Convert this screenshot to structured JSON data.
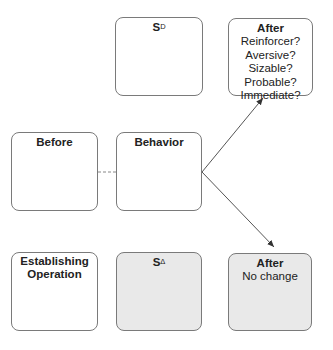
{
  "diagram": {
    "boxes": {
      "sd": {
        "label": "S",
        "sup": "D"
      },
      "after_top": {
        "title": "After",
        "lines": [
          "Reinforcer?",
          "Aversive?",
          "Sizable?",
          "Probable?",
          "Immediate?"
        ]
      },
      "before": {
        "title": "Before"
      },
      "behavior": {
        "title": "Behavior"
      },
      "eo": {
        "title_line1": "Establishing",
        "title_line2": "Operation"
      },
      "sdelta": {
        "label": "S",
        "sup": "Δ"
      },
      "after_bottom": {
        "title": "After",
        "lines": [
          "No change"
        ]
      }
    },
    "colors": {
      "border": "#7a7a7a",
      "shaded_fill": "#e9e9e9",
      "line": "#555555"
    }
  }
}
